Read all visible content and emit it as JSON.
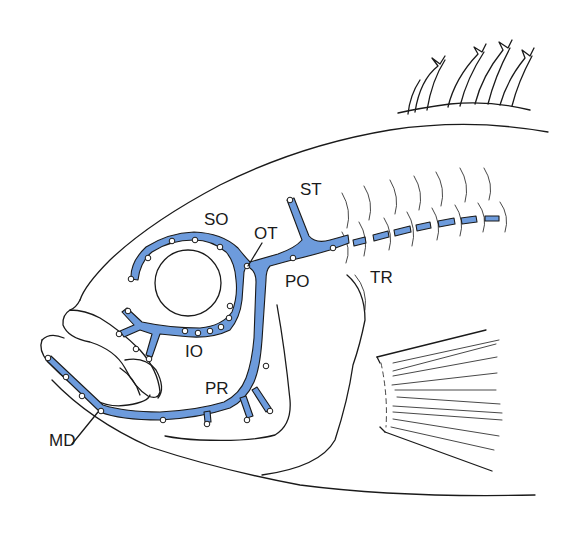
{
  "figure": {
    "colors": {
      "canal_fill": "#6d9bdc",
      "outline": "#1a1a1a",
      "background": "#ffffff",
      "pore_fill": "#ffffff"
    },
    "labels": {
      "so": "SO",
      "ot": "OT",
      "st": "ST",
      "po": "PO",
      "tr": "TR",
      "io": "IO",
      "pr": "PR",
      "md": "MD"
    }
  }
}
